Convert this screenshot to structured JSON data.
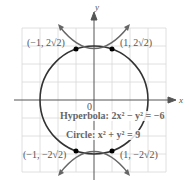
{
  "axes": {
    "x_label": "x",
    "y_label": "y",
    "origin_label": "0"
  },
  "curves": {
    "hyperbola": {
      "label": "Hyperbola: 2x² − y² = −6"
    },
    "circle": {
      "label": "Circle: x² + y² = 9"
    }
  },
  "points": [
    {
      "label": "(−1, 2√2)"
    },
    {
      "label": "(1, 2√2)"
    },
    {
      "label": "(−1, −2√2)"
    },
    {
      "label": "(1, −2√2)"
    }
  ],
  "colors": {
    "grid": "#d8d8d8",
    "curve": "#333333",
    "hyperbola": "#666666",
    "axis": "#555555"
  }
}
